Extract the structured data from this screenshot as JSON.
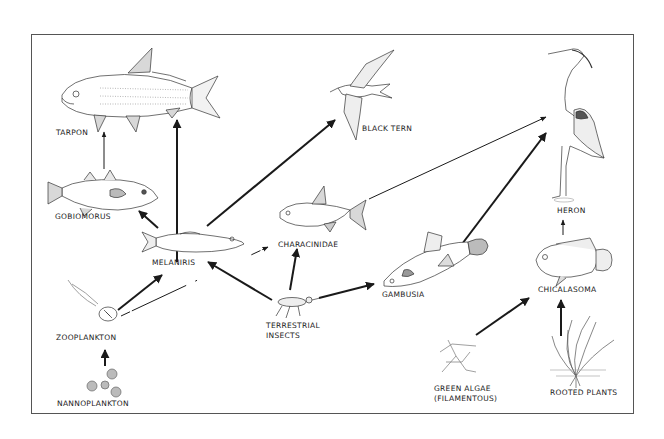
{
  "diagram": {
    "type": "food-web",
    "colors": {
      "ink": "#1a1a1a",
      "frame": "#555555",
      "background": "#ffffff",
      "fill_shade": "#cfcfcf"
    },
    "nodes": [
      {
        "id": "tarpon",
        "label": "TARPON"
      },
      {
        "id": "gobiomorus",
        "label": "GOBIOMORUS"
      },
      {
        "id": "melaniris",
        "label": "MELANIRIS"
      },
      {
        "id": "black_tern",
        "label": "BLACK TERN"
      },
      {
        "id": "characinidae",
        "label": "CHARACINIDAE"
      },
      {
        "id": "heron",
        "label": "HERON"
      },
      {
        "id": "gambusia",
        "label": "GAMBUSIA"
      },
      {
        "id": "chicalasoma",
        "label": "CHICALASOMA"
      },
      {
        "id": "zooplankton",
        "label": "ZOOPLANKTON"
      },
      {
        "id": "terrestrial_insects",
        "label_line1": "TERRESTRIAL",
        "label_line2": "INSECTS"
      },
      {
        "id": "nannoplankton",
        "label": "NANNOPLANKTON"
      },
      {
        "id": "green_algae",
        "label_line1": "GREEN ALGAE",
        "label_line2": "(FILAMENTOUS)"
      },
      {
        "id": "rooted_plants",
        "label": "ROOTED PLANTS"
      }
    ],
    "edges": [
      {
        "from": "gobiomorus",
        "to": "tarpon",
        "weight": "thin"
      },
      {
        "from": "melaniris",
        "to": "tarpon",
        "weight": "thick"
      },
      {
        "from": "melaniris",
        "to": "gobiomorus",
        "weight": "thick"
      },
      {
        "from": "melaniris",
        "to": "black_tern",
        "weight": "thick"
      },
      {
        "from": "characinidae",
        "to": "heron",
        "weight": "thin"
      },
      {
        "from": "gambusia",
        "to": "heron",
        "weight": "thick"
      },
      {
        "from": "chicalasoma",
        "to": "heron",
        "weight": "thin"
      },
      {
        "from": "zooplankton",
        "to": "melaniris",
        "weight": "thick"
      },
      {
        "from": "zooplankton",
        "to": "characinidae",
        "weight": "thin"
      },
      {
        "from": "terrestrial_insects",
        "to": "melaniris",
        "weight": "thick"
      },
      {
        "from": "terrestrial_insects",
        "to": "characinidae",
        "weight": "thick"
      },
      {
        "from": "terrestrial_insects",
        "to": "gambusia",
        "weight": "thick"
      },
      {
        "from": "nannoplankton",
        "to": "zooplankton",
        "weight": "thick"
      },
      {
        "from": "green_algae",
        "to": "chicalasoma",
        "weight": "thick"
      },
      {
        "from": "rooted_plants",
        "to": "chicalasoma",
        "weight": "thick"
      }
    ]
  }
}
